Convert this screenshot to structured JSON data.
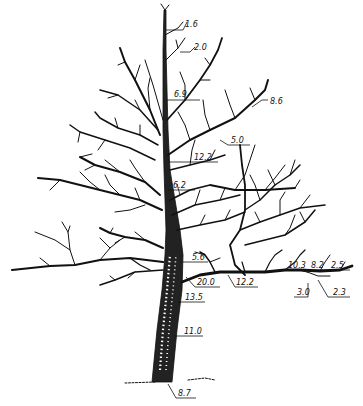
{
  "diagram": {
    "type": "tree-branch-diameter-diagram",
    "labels": [
      {
        "id": "l1",
        "value": "1.6",
        "x": 185,
        "y": 27
      },
      {
        "id": "l2",
        "value": "2.0",
        "x": 194,
        "y": 50
      },
      {
        "id": "l3",
        "value": "6.9",
        "x": 174,
        "y": 97
      },
      {
        "id": "l4",
        "value": "8.6",
        "x": 270,
        "y": 104
      },
      {
        "id": "l5",
        "value": "5.0",
        "x": 231,
        "y": 143
      },
      {
        "id": "l6",
        "value": "12.2",
        "x": 194,
        "y": 161
      },
      {
        "id": "l7",
        "value": "6.2",
        "x": 173,
        "y": 189
      },
      {
        "id": "l8",
        "value": "5.6",
        "x": 192,
        "y": 261
      },
      {
        "id": "l9",
        "value": "20.0",
        "x": 197,
        "y": 285
      },
      {
        "id": "l10",
        "value": "12.2",
        "x": 235,
        "y": 285
      },
      {
        "id": "l11",
        "value": "13.5",
        "x": 185,
        "y": 300
      },
      {
        "id": "l12",
        "value": "11.0",
        "x": 185,
        "y": 334
      },
      {
        "id": "l13",
        "value": "10.3",
        "x": 288,
        "y": 268
      },
      {
        "id": "l14",
        "value": "8.2",
        "x": 311,
        "y": 268
      },
      {
        "id": "l15",
        "value": "2.5",
        "x": 331,
        "y": 268
      },
      {
        "id": "l16",
        "value": "3.0",
        "x": 297,
        "y": 295
      },
      {
        "id": "l17",
        "value": "2.3",
        "x": 333,
        "y": 295
      },
      {
        "id": "l18",
        "value": "8.7",
        "x": 178,
        "y": 396
      }
    ],
    "colors": {
      "ink": "#111111",
      "background": "#ffffff"
    }
  }
}
